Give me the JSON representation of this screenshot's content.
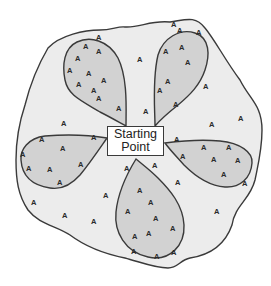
{
  "diagram": {
    "center_node": {
      "line1": "Starting",
      "line2": "Point"
    },
    "point_label": "A",
    "colors": {
      "background": "#ffffff",
      "outer_region_fill": "#ececec",
      "petal_fill": "#d2d2d2",
      "stroke": "#3a3a3a",
      "text": "#222222"
    },
    "regions": [
      {
        "name": "outer-area",
        "description": "irregular blob containing all points"
      },
      {
        "name": "petal-upper-left",
        "point_count": 11
      },
      {
        "name": "petal-upper-right",
        "point_count": 8
      },
      {
        "name": "petal-left",
        "point_count": 8
      },
      {
        "name": "petal-right",
        "point_count": 9
      },
      {
        "name": "petal-bottom",
        "point_count": 13
      }
    ]
  }
}
